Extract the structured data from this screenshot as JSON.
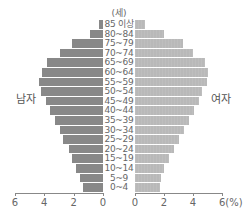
{
  "chart_data": {
    "type": "bar",
    "subtype": "population-pyramid",
    "title": "",
    "unit_label": "(세)",
    "xlabel": "(%)",
    "ylabel": "(세)",
    "left_label": "남자",
    "right_label": "여자",
    "categories": [
      "85 이상",
      "80~84",
      "75~79",
      "70~74",
      "65~69",
      "60~64",
      "55~59",
      "50~54",
      "45~49",
      "40~44",
      "35~39",
      "30~34",
      "25~29",
      "20~24",
      "15~19",
      "10~14",
      "5~9",
      "0~4"
    ],
    "series": [
      {
        "name": "남자",
        "color": "#888888",
        "values": [
          0.3,
          0.9,
          2.1,
          2.95,
          3.85,
          4.15,
          4.35,
          4.2,
          3.9,
          3.6,
          3.3,
          2.95,
          2.7,
          2.35,
          2.1,
          1.85,
          1.6,
          1.4
        ]
      },
      {
        "name": "여자",
        "color": "#b9b9b9",
        "values": [
          0.7,
          2.0,
          3.3,
          4.0,
          4.8,
          5.05,
          4.95,
          4.6,
          4.4,
          4.1,
          3.75,
          3.35,
          3.0,
          2.7,
          2.35,
          2.0,
          1.8,
          1.7
        ]
      }
    ],
    "xlim_left": [
      6,
      0
    ],
    "xlim_right": [
      0,
      6
    ],
    "left_ticks": [
      "6",
      "4",
      "2",
      "0"
    ],
    "right_ticks": [
      "0",
      "2",
      "4",
      "6(%)"
    ],
    "grid": false,
    "legend": "side labels (남자 left, 여자 right)"
  }
}
